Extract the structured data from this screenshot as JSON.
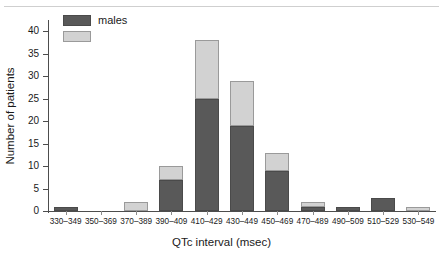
{
  "chart_data": {
    "type": "bar",
    "subtype": "stacked-histogram",
    "title": "",
    "xlabel": "QTc interval (msec)",
    "ylabel": "Number of patients",
    "ylim": [
      0,
      42
    ],
    "yticks": [
      0,
      5,
      10,
      15,
      20,
      25,
      30,
      35,
      40
    ],
    "ytick_labels": [
      "0",
      "5",
      "10",
      "15",
      "20",
      "25",
      "30",
      "35",
      "40"
    ],
    "grid": false,
    "legend_position": "top-left",
    "categories": [
      "330–349",
      "350–369",
      "370–389",
      "390–409",
      "410–429",
      "430–449",
      "450–469",
      "470–489",
      "490–509",
      "510–529",
      "530–549"
    ],
    "series": [
      {
        "name": "males",
        "label": "males",
        "color": "#595959",
        "values": [
          1,
          0,
          0,
          7,
          25,
          19,
          9,
          1,
          1,
          3,
          0
        ]
      },
      {
        "name": "unlabeled",
        "label": "",
        "color": "#d2d2d2",
        "values": [
          0,
          0,
          2,
          3,
          13,
          10,
          4,
          1,
          0,
          0,
          1
        ]
      }
    ],
    "totals": [
      1,
      0,
      2,
      10,
      38,
      29,
      13,
      2,
      1,
      3,
      1
    ]
  },
  "legend": {
    "items": [
      {
        "label": "males",
        "color": "#595959"
      },
      {
        "label": "",
        "color": "#d2d2d2"
      }
    ]
  },
  "colors": {
    "males": "#595959",
    "other": "#d2d2d2",
    "axis": "#4d4d4d",
    "background": "#ffffff"
  }
}
